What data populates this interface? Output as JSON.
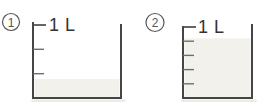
{
  "figures": [
    {
      "number": "1",
      "capacity_label": "1 L",
      "divisions": 3,
      "filled_fraction": 0.26
    },
    {
      "number": "2",
      "capacity_label": "1 L",
      "divisions": 5,
      "filled_fraction": 0.84
    }
  ],
  "colors": {
    "background": "#ffffff",
    "outline": "#454545",
    "tick": "#6e6e6e",
    "top_tick": "#4a4a4a",
    "water_fill": "#f2f1ec",
    "label_text": "#333333",
    "badge": "#555555",
    "shadow": "#dedeD8"
  }
}
